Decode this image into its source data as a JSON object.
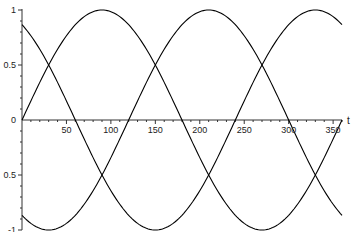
{
  "chart_data": {
    "type": "line",
    "title": "",
    "xlabel": "t",
    "ylabel": "",
    "xlim": [
      0,
      360
    ],
    "ylim": [
      -1,
      1
    ],
    "grid": false,
    "legend": null,
    "x_ticks": [
      50,
      100,
      150,
      200,
      250,
      300,
      350
    ],
    "x_tick_labels": [
      "50",
      "100",
      "150",
      "200",
      "250",
      "300",
      "350"
    ],
    "y_ticks": [
      1,
      0.5,
      0,
      -0.5,
      -1
    ],
    "y_tick_labels": [
      "1",
      "0.5",
      "0",
      "0.5",
      "-1"
    ],
    "x_minor_step": 10,
    "y_minor_step": 0.1,
    "series": [
      {
        "name": "sin(t)",
        "phase_deg": 0,
        "color": "#000000",
        "x": [
          0,
          30,
          60,
          90,
          120,
          150,
          180,
          210,
          240,
          270,
          300,
          330,
          360
        ],
        "values": [
          0,
          0.5,
          0.866,
          1,
          0.866,
          0.5,
          0,
          -0.5,
          -0.866,
          -1,
          -0.866,
          -0.5,
          0
        ]
      },
      {
        "name": "sin(t+120)",
        "phase_deg": 120,
        "color": "#000000",
        "x": [
          0,
          30,
          60,
          90,
          120,
          150,
          180,
          210,
          240,
          270,
          300,
          330,
          360
        ],
        "values": [
          0.866,
          0.5,
          0,
          -0.5,
          -0.866,
          -1,
          -0.866,
          -0.5,
          0,
          0.5,
          0.866,
          1,
          0.866
        ]
      },
      {
        "name": "sin(t-120)",
        "phase_deg": -120,
        "color": "#000000",
        "x": [
          0,
          30,
          60,
          90,
          120,
          150,
          180,
          210,
          240,
          270,
          300,
          330,
          360
        ],
        "values": [
          -0.866,
          -1,
          -0.866,
          -0.5,
          0,
          0.5,
          0.866,
          1,
          0.866,
          0.5,
          0,
          -0.5,
          -0.866
        ]
      }
    ]
  }
}
